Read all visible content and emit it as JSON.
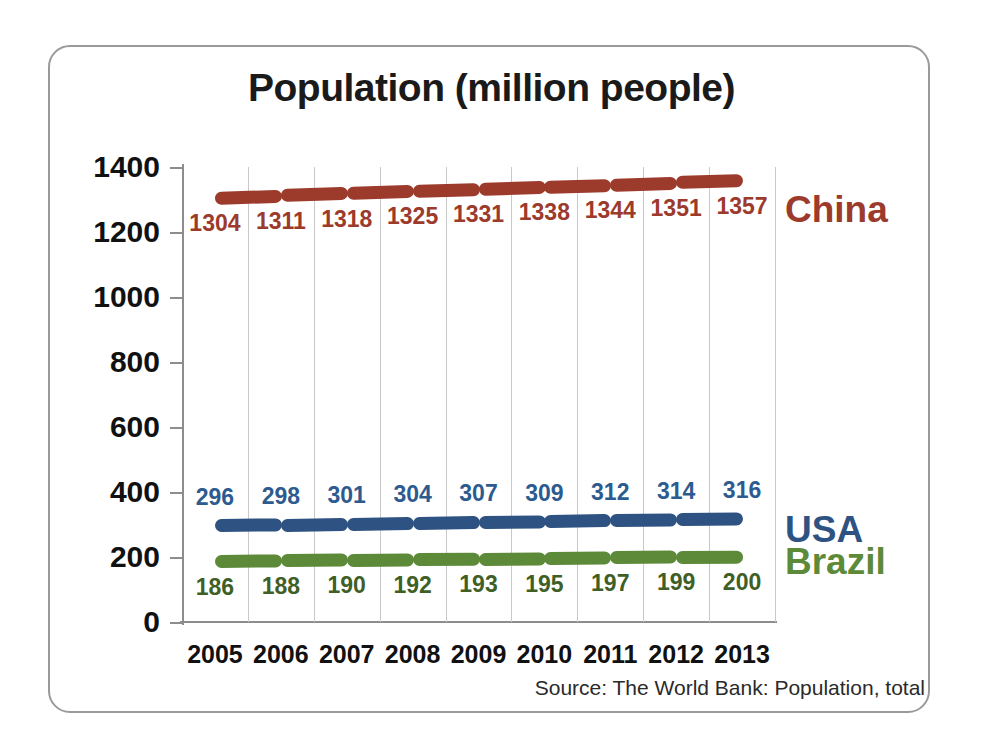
{
  "frame": {
    "border_color": "#9a9a9a"
  },
  "chart_data": {
    "type": "line",
    "title": "Population (million people)",
    "xlabel": "",
    "ylabel": "",
    "categories": [
      "2005",
      "2006",
      "2007",
      "2008",
      "2009",
      "2010",
      "2011",
      "2012",
      "2013"
    ],
    "ylim": [
      0,
      1400
    ],
    "yticks": [
      0,
      200,
      400,
      600,
      800,
      1000,
      1200,
      1400
    ],
    "ytick_labels": [
      "0",
      "200",
      "400",
      "600",
      "800",
      "1000",
      "1200",
      "1400"
    ],
    "grid": "vertical-only",
    "legend": "right-of-plot-inline-labels",
    "series": [
      {
        "name": "China",
        "color": "#9c3a2c",
        "label_color": "#9c3a2c",
        "values": [
          1304,
          1311,
          1318,
          1325,
          1331,
          1338,
          1344,
          1351,
          1357
        ],
        "label_position": "below"
      },
      {
        "name": "USA",
        "color": "#2e5282",
        "label_color": "#2e5b8f",
        "values": [
          296,
          298,
          301,
          304,
          307,
          309,
          312,
          314,
          316
        ],
        "label_position": "above"
      },
      {
        "name": "Brazil",
        "color": "#5d8a38",
        "label_color": "#3f5f26",
        "values": [
          186,
          188,
          190,
          192,
          193,
          195,
          197,
          199,
          200
        ],
        "label_position": "below"
      }
    ],
    "source": "Source: The World Bank: Population, total"
  }
}
